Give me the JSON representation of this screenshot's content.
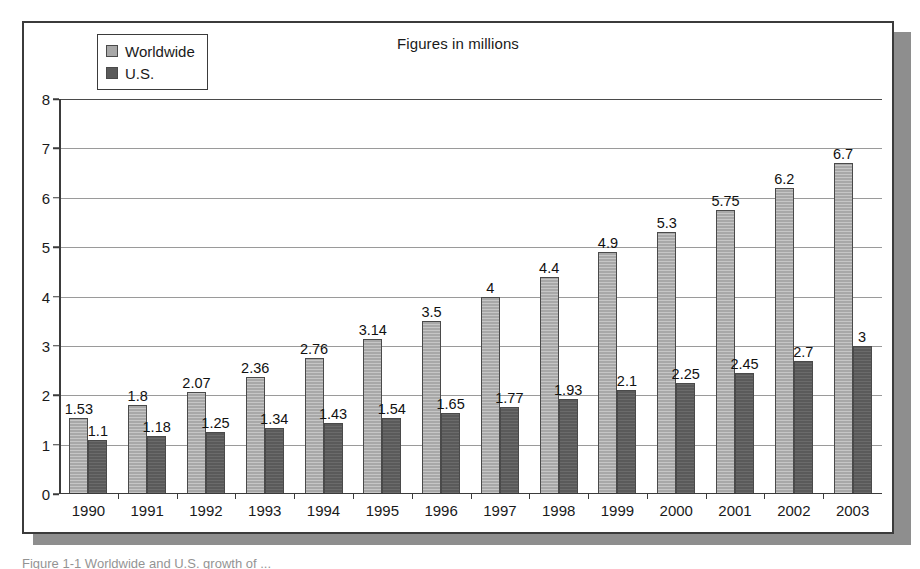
{
  "chart_data": {
    "type": "bar",
    "title": "Figures in millions",
    "xlabel": "",
    "ylabel": "",
    "ylim": [
      0,
      8
    ],
    "yticks": [
      0,
      1,
      2,
      3,
      4,
      5,
      6,
      7,
      8
    ],
    "grid": true,
    "legend_position": "top-left",
    "categories": [
      "1990",
      "1991",
      "1992",
      "1993",
      "1994",
      "1995",
      "1996",
      "1997",
      "1998",
      "1999",
      "2000",
      "2001",
      "2002",
      "2003"
    ],
    "series": [
      {
        "name": "Worldwide",
        "color": "#a8a8a8",
        "values": [
          1.53,
          1.8,
          2.07,
          2.36,
          2.76,
          3.14,
          3.5,
          4,
          4.4,
          4.9,
          5.3,
          5.75,
          6.2,
          6.7
        ],
        "labels": [
          "1.53",
          "1.8",
          "2.07",
          "2.36",
          "2.76",
          "3.14",
          "3.5",
          "4",
          "4.4",
          "4.9",
          "5.3",
          "5.75",
          "6.2",
          "6.7"
        ]
      },
      {
        "name": "U.S.",
        "color": "#5a5a5a",
        "values": [
          1.1,
          1.18,
          1.25,
          1.34,
          1.43,
          1.54,
          1.65,
          1.77,
          1.93,
          2.1,
          2.25,
          2.45,
          2.7,
          3
        ],
        "labels": [
          "1.1",
          "1.18",
          "1.25",
          "1.34",
          "1.43",
          "1.54",
          "1.65",
          "1.77",
          "1.93",
          "2.1",
          "2.25",
          "2.45",
          "2.7",
          "3"
        ]
      }
    ]
  },
  "legend": {
    "items": [
      {
        "label": "Worldwide",
        "swatch": "#a8a8a8"
      },
      {
        "label": "U.S.",
        "swatch": "#5a5a5a"
      }
    ]
  },
  "caption": {
    "text": "Figure 1-1  Worldwide and U.S. growth of ..."
  },
  "colors": {
    "worldwide": "#a8a8a8",
    "us": "#5a5a5a",
    "frame_border": "#3b3b3b",
    "shadow": "#8e8e8e",
    "gridline": "#9a9a9a"
  }
}
